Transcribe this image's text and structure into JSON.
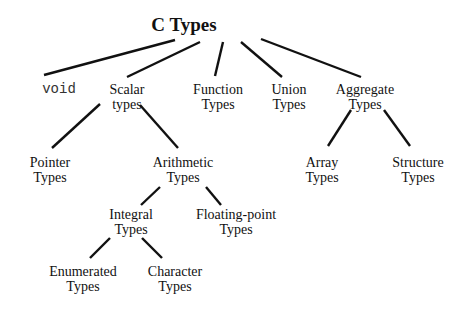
{
  "diagram": {
    "type": "tree",
    "title": "C Types",
    "root": {
      "id": "c-types",
      "lines": [
        "C Types"
      ]
    },
    "nodes": [
      {
        "id": "void",
        "lines": [
          "void"
        ],
        "parent": "c-types",
        "style": "monospace"
      },
      {
        "id": "scalar",
        "lines": [
          "Scalar",
          "types"
        ],
        "parent": "c-types"
      },
      {
        "id": "function",
        "lines": [
          "Function",
          "Types"
        ],
        "parent": "c-types"
      },
      {
        "id": "union",
        "lines": [
          "Union",
          "Types"
        ],
        "parent": "c-types"
      },
      {
        "id": "aggregate",
        "lines": [
          "Aggregate",
          "Types"
        ],
        "parent": "c-types"
      },
      {
        "id": "pointer",
        "lines": [
          "Pointer",
          "Types"
        ],
        "parent": "scalar"
      },
      {
        "id": "arithmetic",
        "lines": [
          "Arithmetic",
          "Types"
        ],
        "parent": "scalar"
      },
      {
        "id": "array",
        "lines": [
          "Array",
          "Types"
        ],
        "parent": "aggregate"
      },
      {
        "id": "structure",
        "lines": [
          "Structure",
          "Types"
        ],
        "parent": "aggregate"
      },
      {
        "id": "integral",
        "lines": [
          "Integral",
          "Types"
        ],
        "parent": "arithmetic"
      },
      {
        "id": "floating",
        "lines": [
          "Floating-point",
          "Types"
        ],
        "parent": "arithmetic"
      },
      {
        "id": "enumerated",
        "lines": [
          "Enumerated",
          "Types"
        ],
        "parent": "integral"
      },
      {
        "id": "character",
        "lines": [
          "Character",
          "Types"
        ],
        "parent": "integral"
      }
    ],
    "edges": [
      [
        "c-types",
        "void"
      ],
      [
        "c-types",
        "scalar"
      ],
      [
        "c-types",
        "function"
      ],
      [
        "c-types",
        "union"
      ],
      [
        "c-types",
        "aggregate"
      ],
      [
        "scalar",
        "pointer"
      ],
      [
        "scalar",
        "arithmetic"
      ],
      [
        "aggregate",
        "array"
      ],
      [
        "aggregate",
        "structure"
      ],
      [
        "arithmetic",
        "integral"
      ],
      [
        "arithmetic",
        "floating"
      ],
      [
        "integral",
        "enumerated"
      ],
      [
        "integral",
        "character"
      ]
    ]
  }
}
